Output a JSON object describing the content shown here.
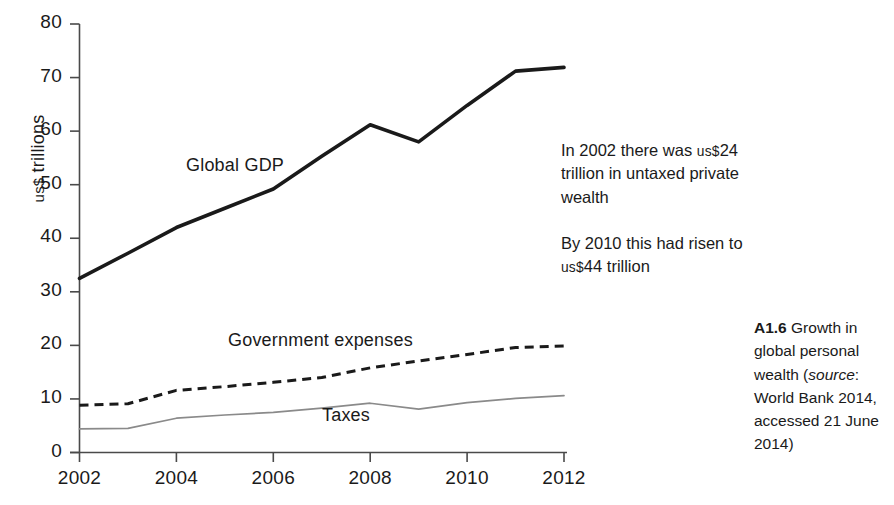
{
  "figure": {
    "y_axis_title_prefix": "us$",
    "y_axis_title_rest": " trillions"
  },
  "annotation": {
    "line1_a": "In 2002 there was ",
    "line1_smallcaps": "us$",
    "line1_b": "24 trillion in untaxed private wealth",
    "line2_a": "By 2010 this had risen to ",
    "line2_smallcaps": "us$",
    "line2_b": "44 trillion"
  },
  "caption": {
    "number": "A1.6",
    "text_before_source": " Growth in global personal wealth (",
    "source_word": "source",
    "text_after_source": ": World Bank 2014, accessed 21 June 2014)"
  },
  "chart_data": {
    "type": "line",
    "title": "Growth in global personal wealth",
    "xlabel": "",
    "ylabel": "us$ trillions",
    "xlim": [
      2002,
      2012
    ],
    "ylim": [
      0,
      80
    ],
    "grid": false,
    "legend": "inline-labels",
    "x": [
      2002,
      2003,
      2004,
      2005,
      2006,
      2007,
      2008,
      2009,
      2010,
      2011,
      2012
    ],
    "xticks": [
      2002,
      2004,
      2006,
      2008,
      2010,
      2012
    ],
    "yticks": [
      0,
      10,
      20,
      30,
      40,
      50,
      60,
      70,
      80
    ],
    "series": [
      {
        "name": "Global GDP",
        "style": "solid-thick-black",
        "color": "#1a1a1a",
        "values": [
          32.5,
          37.2,
          42.0,
          45.6,
          49.2,
          55.3,
          61.2,
          58.0,
          64.8,
          71.2,
          71.9
        ]
      },
      {
        "name": "Government expenses",
        "style": "dashed-black",
        "color": "#1a1a1a",
        "values": [
          8.8,
          9.1,
          11.6,
          12.3,
          13.1,
          14.0,
          15.8,
          17.1,
          18.3,
          19.6,
          19.9
        ]
      },
      {
        "name": "Taxes",
        "style": "solid-thin-gray",
        "color": "#8a8a8a",
        "values": [
          4.4,
          4.5,
          6.4,
          7.0,
          7.5,
          8.3,
          9.2,
          8.1,
          9.3,
          10.1,
          10.6
        ]
      }
    ]
  }
}
